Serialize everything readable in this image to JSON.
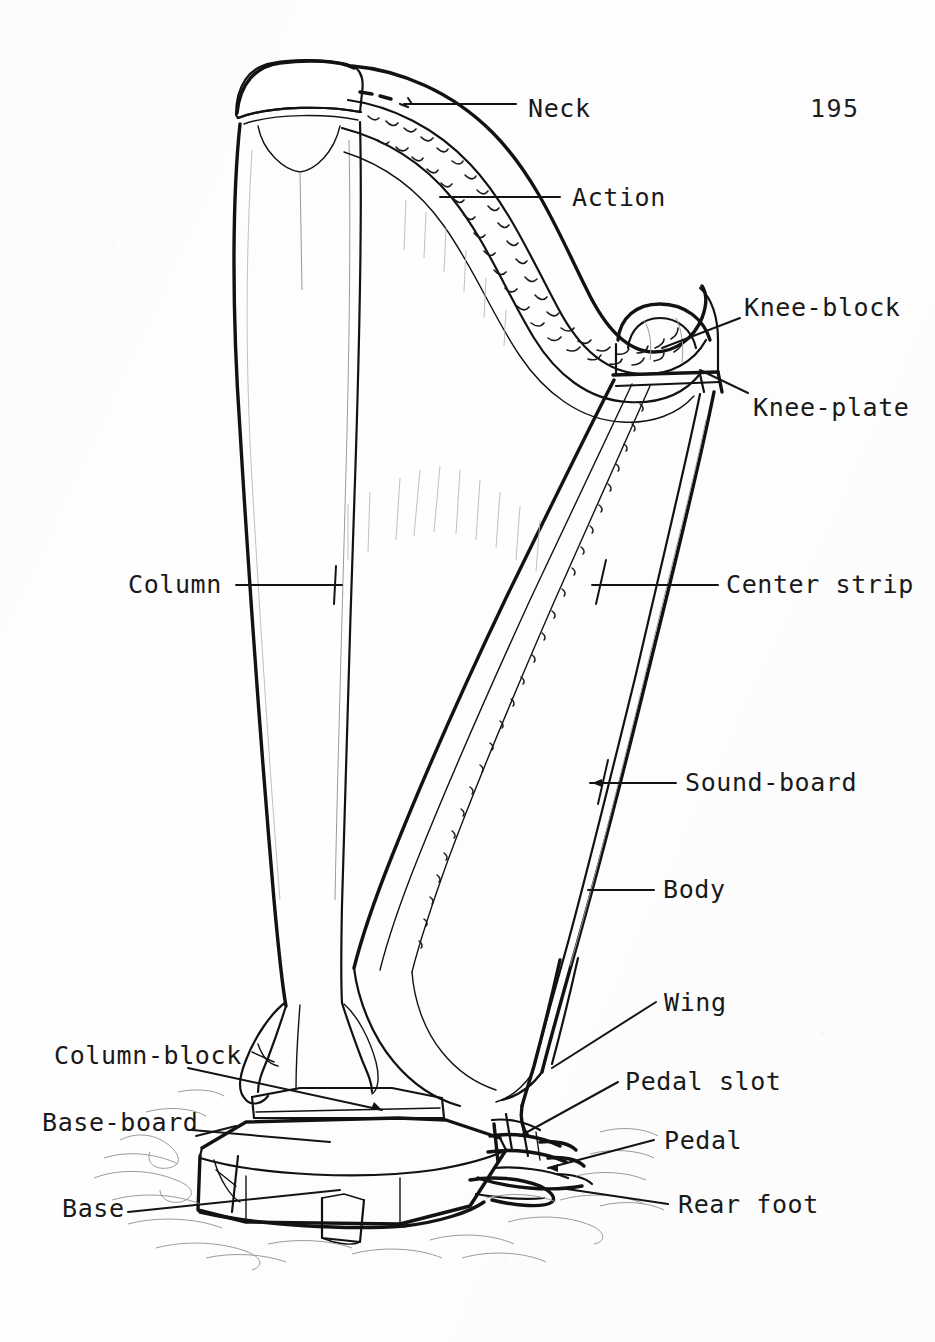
{
  "document": {
    "page_number": "195",
    "figure_type": "labeled line drawing of a concert pedal harp"
  },
  "labels": [
    {
      "id": "neck",
      "text": "Neck",
      "x": 528,
      "y": 96,
      "align": "left"
    },
    {
      "id": "action",
      "text": "Action",
      "x": 572,
      "y": 185,
      "align": "left"
    },
    {
      "id": "knee_block",
      "text": "Knee-block",
      "x": 744,
      "y": 295,
      "align": "left"
    },
    {
      "id": "knee_plate",
      "text": "Knee-plate",
      "x": 753,
      "y": 395,
      "align": "left"
    },
    {
      "id": "center_strip",
      "text": "Center strip",
      "x": 726,
      "y": 582,
      "align": "left"
    },
    {
      "id": "sound_board",
      "text": "Sound-board",
      "x": 685,
      "y": 775,
      "align": "left"
    },
    {
      "id": "body",
      "text": "Body",
      "x": 663,
      "y": 884,
      "align": "left"
    },
    {
      "id": "wing",
      "text": "Wing",
      "x": 664,
      "y": 1003,
      "align": "left"
    },
    {
      "id": "pedal_slot",
      "text": "Pedal slot",
      "x": 625,
      "y": 1080,
      "align": "left"
    },
    {
      "id": "pedal",
      "text": "Pedal",
      "x": 664,
      "y": 1141,
      "align": "left"
    },
    {
      "id": "rear_foot",
      "text": "Rear foot",
      "x": 678,
      "y": 1203,
      "align": "left"
    },
    {
      "id": "column",
      "text": "Column",
      "x": 128,
      "y": 579,
      "align": "left"
    },
    {
      "id": "column_block",
      "text": "Column-block",
      "x": 54,
      "y": 1053,
      "align": "left"
    },
    {
      "id": "base_board",
      "text": "Base-board",
      "x": 42,
      "y": 1122,
      "align": "left"
    },
    {
      "id": "base",
      "text": "Base",
      "x": 62,
      "y": 1208,
      "align": "left"
    }
  ],
  "colors": {
    "ink": "#121212",
    "paper": "#fefefe",
    "ghost": "#9a9a9a"
  },
  "parts_described": [
    "Neck",
    "Action",
    "Knee-block",
    "Knee-plate",
    "Center strip",
    "Sound-board",
    "Body",
    "Wing",
    "Pedal slot",
    "Pedal",
    "Rear foot",
    "Column",
    "Column-block",
    "Base-board",
    "Base"
  ]
}
